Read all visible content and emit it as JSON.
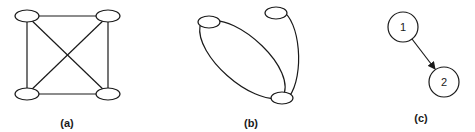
{
  "figure": {
    "panels": [
      {
        "id": "a",
        "caption": "(a)",
        "description": "Complete graph on 4 unlabeled nodes (K4)",
        "nodes": [
          {
            "id": "a1",
            "cx": 27,
            "cy": 16,
            "label": ""
          },
          {
            "id": "a2",
            "cx": 108,
            "cy": 16,
            "label": ""
          },
          {
            "id": "a3",
            "cx": 27,
            "cy": 94,
            "label": ""
          },
          {
            "id": "a4",
            "cx": 108,
            "cy": 94,
            "label": ""
          }
        ],
        "edges": [
          [
            "a1",
            "a2"
          ],
          [
            "a1",
            "a3"
          ],
          [
            "a1",
            "a4"
          ],
          [
            "a2",
            "a3"
          ],
          [
            "a2",
            "a4"
          ],
          [
            "a3",
            "a4"
          ]
        ]
      },
      {
        "id": "b",
        "caption": "(b)",
        "description": "Three unlabeled nodes with curved edges; one node pair joined by two arcs forming a loop",
        "nodes": [
          {
            "id": "b1",
            "cx": 209,
            "cy": 22,
            "label": ""
          },
          {
            "id": "b2",
            "cx": 276,
            "cy": 13,
            "label": ""
          },
          {
            "id": "b3",
            "cx": 282,
            "cy": 98,
            "label": ""
          }
        ],
        "edges": [
          [
            "b1",
            "b3"
          ],
          [
            "b1",
            "b3"
          ],
          [
            "b2",
            "b3"
          ]
        ]
      },
      {
        "id": "c",
        "caption": "(c)",
        "description": "Directed edge from node 1 to node 2",
        "nodes": [
          {
            "id": "c1",
            "cx": 403,
            "cy": 27,
            "label": "1"
          },
          {
            "id": "c2",
            "cx": 444,
            "cy": 82,
            "label": "2"
          }
        ],
        "edges": [
          [
            "c1",
            "c2"
          ]
        ],
        "directed": true
      }
    ]
  },
  "labels": {
    "a": "(a)",
    "b": "(b)",
    "c": "(c)",
    "node1": "1",
    "node2": "2"
  },
  "colors": {
    "stroke": "#1a1a1a",
    "background": "#ffffff"
  }
}
